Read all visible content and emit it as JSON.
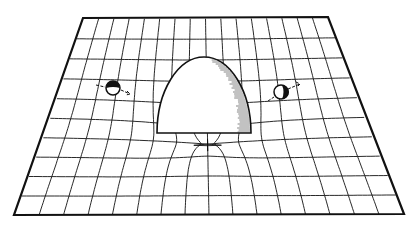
{
  "figure": {
    "caption_cropped": "",
    "stroke_color": "#111111",
    "background": "#ffffff",
    "sheet": {
      "corners": {
        "top_left": [
          83,
          18
        ],
        "top_right": [
          328,
          17
        ],
        "bottom_right": [
          404,
          214
        ],
        "bottom_left": [
          14,
          215
        ]
      }
    },
    "sun": {
      "label": "sun",
      "center_x": 204,
      "base_y": 133,
      "rx": 47,
      "top_y": 57
    },
    "planets": [
      {
        "label": "planet-left",
        "cx": 113,
        "cy": 88,
        "r": 7,
        "direction": "right"
      },
      {
        "label": "planet-right",
        "cx": 281,
        "cy": 92,
        "r": 7,
        "direction": "up-right"
      }
    ]
  }
}
